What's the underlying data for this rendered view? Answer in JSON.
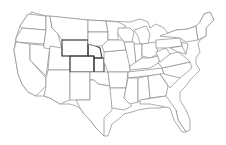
{
  "map": {
    "title": "",
    "region": "United States (contiguous)",
    "style": "state outline",
    "colors": {
      "background": "#ffffff",
      "border": "#8a8a8a",
      "highlight_border": "#3a3a3a"
    },
    "highlighted_region": [
      "Wyoming",
      "Nebraska",
      "Colorado",
      "Kansas"
    ]
  }
}
